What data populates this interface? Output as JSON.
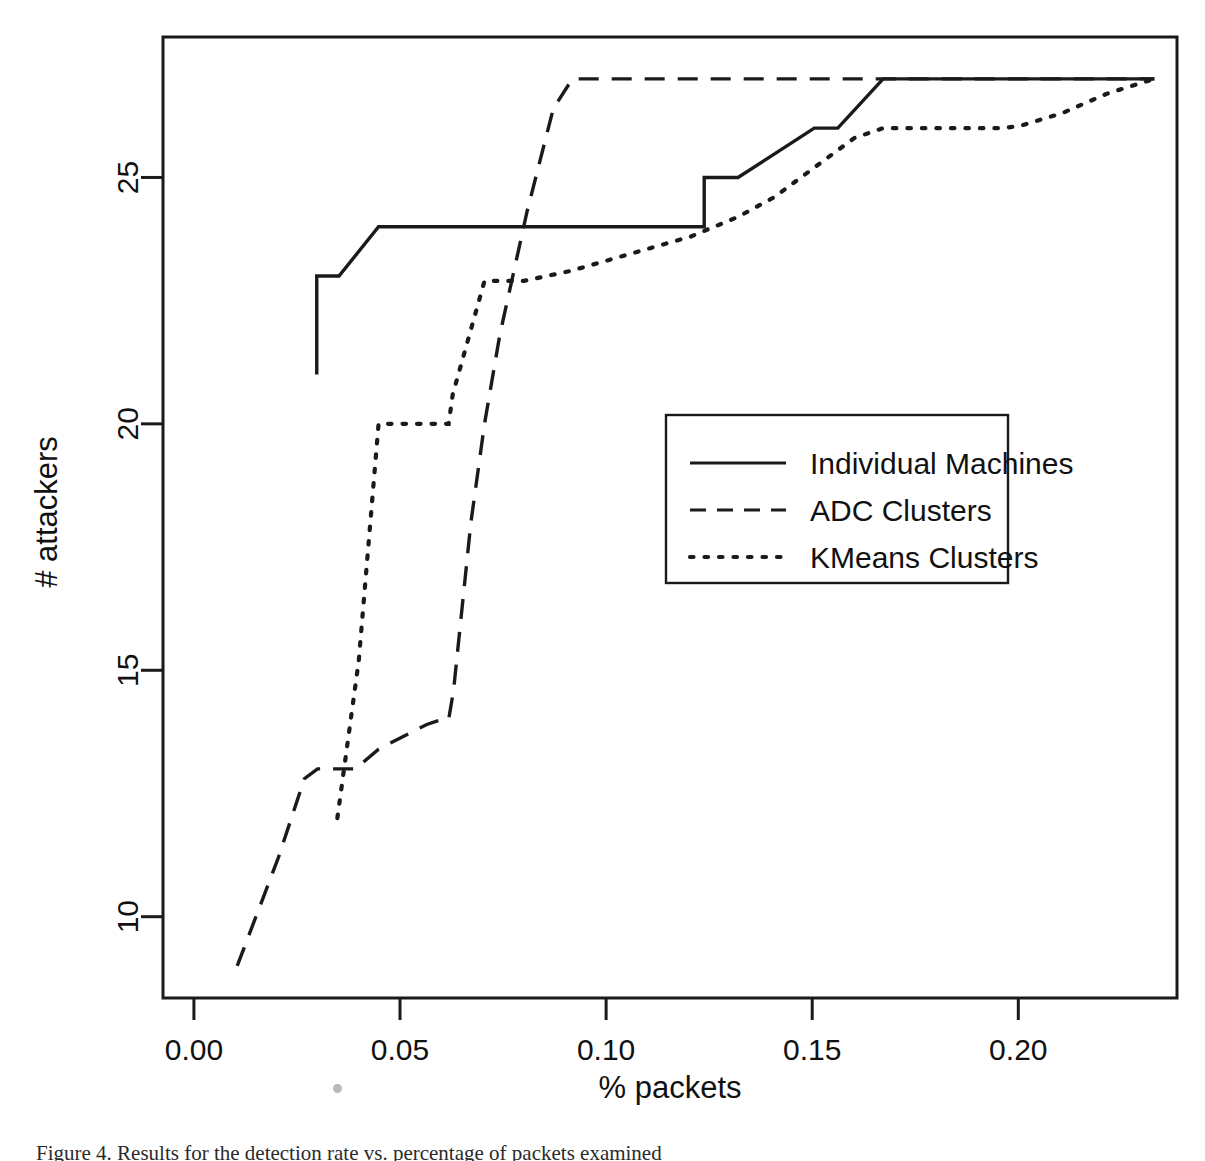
{
  "figure": {
    "caption": "Figure 4. Results for the detection rate vs. percentage of packets examined"
  },
  "axes": {
    "x_label": "% packets",
    "y_label": "# attackers",
    "x_ticks": [
      "0.00",
      "0.05",
      "0.10",
      "0.15",
      "0.20"
    ],
    "y_ticks": [
      "10",
      "15",
      "20",
      "25"
    ]
  },
  "legend": {
    "entries": [
      {
        "label": "Individual Machines",
        "style": "solid"
      },
      {
        "label": "ADC Clusters",
        "style": "dashed"
      },
      {
        "label": "KMeans Clusters",
        "style": "dotted"
      }
    ]
  },
  "chart_data": {
    "type": "line",
    "title": "",
    "xlabel": "% packets",
    "ylabel": "# attackers",
    "xlim": [
      -0.0075,
      0.2385
    ],
    "ylim": [
      8.35,
      27.85
    ],
    "grid": false,
    "legend_position": "center-right",
    "x_ticks": [
      0.0,
      0.05,
      0.1,
      0.15,
      0.2
    ],
    "y_ticks": [
      10,
      15,
      20,
      25
    ],
    "series": [
      {
        "name": "Individual Machines",
        "style": "solid",
        "points": [
          [
            0.0298,
            21.0
          ],
          [
            0.0298,
            23.0
          ],
          [
            0.033,
            23.0
          ],
          [
            0.0352,
            23.0
          ],
          [
            0.0448,
            24.0
          ],
          [
            0.1205,
            24.0
          ],
          [
            0.1238,
            24.0
          ],
          [
            0.1238,
            25.0
          ],
          [
            0.132,
            25.0
          ],
          [
            0.1505,
            26.0
          ],
          [
            0.1562,
            26.0
          ],
          [
            0.1672,
            27.0
          ],
          [
            0.233,
            27.0
          ]
        ]
      },
      {
        "name": "ADC Clusters",
        "style": "dashed",
        "points": [
          [
            0.0105,
            9.0
          ],
          [
            0.0205,
            11.2
          ],
          [
            0.0268,
            12.8
          ],
          [
            0.03,
            13.0
          ],
          [
            0.0392,
            13.0
          ],
          [
            0.0448,
            13.4
          ],
          [
            0.0565,
            13.9
          ],
          [
            0.06,
            14.0
          ],
          [
            0.0618,
            14.0
          ],
          [
            0.063,
            14.6
          ],
          [
            0.0672,
            18.0
          ],
          [
            0.0705,
            20.0
          ],
          [
            0.0742,
            21.8
          ],
          [
            0.0808,
            24.3
          ],
          [
            0.0872,
            26.4
          ],
          [
            0.0918,
            27.0
          ],
          [
            0.233,
            27.0
          ]
        ]
      },
      {
        "name": "KMeans Clusters",
        "style": "dotted",
        "points": [
          [
            0.0348,
            12.0
          ],
          [
            0.04,
            15.2
          ],
          [
            0.0448,
            20.0
          ],
          [
            0.054,
            20.0
          ],
          [
            0.0618,
            20.0
          ],
          [
            0.0628,
            20.6
          ],
          [
            0.0705,
            22.9
          ],
          [
            0.08,
            22.9
          ],
          [
            0.0912,
            23.1
          ],
          [
            0.1038,
            23.4
          ],
          [
            0.1205,
            23.8
          ],
          [
            0.132,
            24.2
          ],
          [
            0.1408,
            24.6
          ],
          [
            0.1505,
            25.2
          ],
          [
            0.1602,
            25.8
          ],
          [
            0.1672,
            26.0
          ],
          [
            0.1805,
            26.0
          ],
          [
            0.1962,
            26.0
          ],
          [
            0.2005,
            26.05
          ],
          [
            0.2105,
            26.3
          ],
          [
            0.2215,
            26.7
          ],
          [
            0.233,
            27.0
          ]
        ]
      }
    ]
  }
}
